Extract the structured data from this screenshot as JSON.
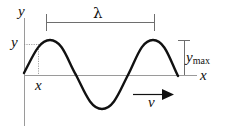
{
  "diagram": {
    "type": "transverse-wave",
    "labels": {
      "y_axis": "y",
      "x_axis": "x",
      "y_point": "y",
      "x_point": "x",
      "wavelength": "λ",
      "amplitude_main": "y",
      "amplitude_sub": "max",
      "velocity": "v"
    },
    "colors": {
      "wave": "#111111",
      "axes": "#9a9a9a",
      "annotations": "#6e6e6e",
      "text": "#111111",
      "background": "#ffffff"
    }
  }
}
